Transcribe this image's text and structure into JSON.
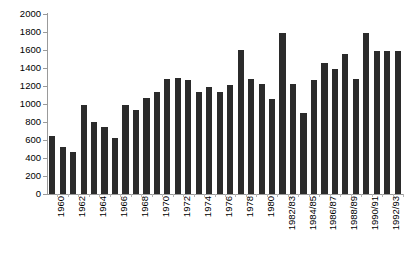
{
  "chart_data": {
    "type": "bar",
    "title": "",
    "subtitle": "",
    "xlabel": "",
    "ylabel": "",
    "ylim": [
      0,
      2000
    ],
    "y_ticks": [
      0,
      200,
      400,
      600,
      800,
      1000,
      1200,
      1400,
      1600,
      1800,
      2000
    ],
    "grid": false,
    "legend": "none",
    "bar_color": "#2b2b2b",
    "axis_color": "#9a9a9a",
    "label_interval": 2,
    "categories": [
      "1960",
      "1961",
      "1962",
      "1963",
      "1964",
      "1965",
      "1966",
      "1967",
      "1968",
      "1969",
      "1970",
      "1971",
      "1972",
      "1973",
      "1974",
      "1975",
      "1976",
      "1977",
      "1978",
      "1979",
      "1980",
      "1981",
      "1982/83",
      "1983/84",
      "1984/85",
      "1985/86",
      "1986/87",
      "1987/88",
      "1988/89",
      "1989/90",
      "1990/91",
      "1991/92",
      "1992/93",
      "1993/94"
    ],
    "tick_labels": [
      "1960",
      "1962",
      "1964",
      "1966",
      "1968",
      "1970",
      "1972",
      "1974",
      "1976",
      "1978",
      "1980",
      "1982/83",
      "1984/85",
      "1986/87",
      "1988/89",
      "1990/91",
      "1992/93"
    ],
    "values": [
      645,
      520,
      465,
      990,
      800,
      745,
      620,
      990,
      935,
      1065,
      1130,
      1280,
      1285,
      1270,
      1135,
      1185,
      1130,
      1215,
      1600,
      1275,
      1225,
      1060,
      1790,
      1225,
      900,
      1270,
      1455,
      1385,
      1560,
      1275,
      1790,
      1590,
      1590,
      1590
    ]
  }
}
